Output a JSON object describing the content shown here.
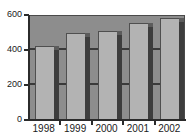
{
  "chart_data": {
    "type": "bar",
    "title": "",
    "xlabel": "",
    "ylabel": "",
    "categories": [
      "1998",
      "1999",
      "2000",
      "2001",
      "2002"
    ],
    "values": [
      420,
      490,
      505,
      550,
      575
    ],
    "ylim": [
      0,
      600
    ],
    "yticks": [
      0,
      200,
      400,
      600
    ],
    "ytick_labels": [
      "0",
      "200",
      "400",
      "600"
    ],
    "grid": true,
    "legend": "none",
    "style": "3d-grayscale-bars",
    "colors": {
      "bar_face": "#b3b3b3",
      "bar_side": "#3d3d3d",
      "plot_background": "#8d8d8d",
      "gridline": "#3a3a3a",
      "axis": "#2b2b2b",
      "text": "#1a1a1a",
      "page_background": "#ffffff"
    }
  }
}
